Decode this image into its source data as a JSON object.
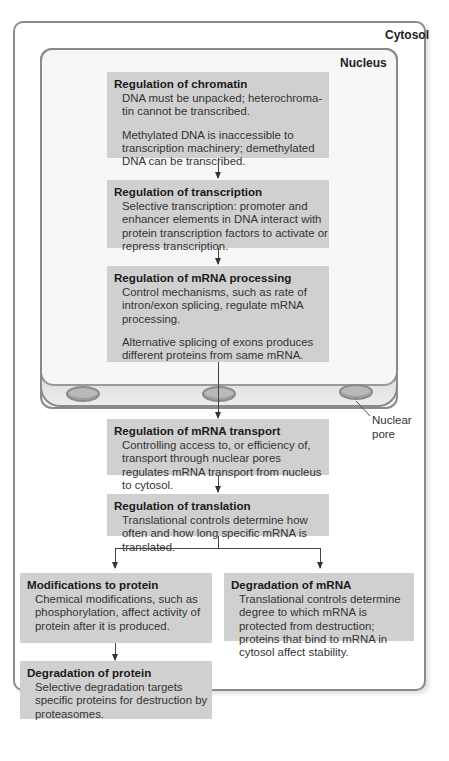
{
  "regions": {
    "cytosol_label": "Cytosol",
    "nucleus_label": "Nucleus",
    "nuclear_pore_label_line1": "Nuclear",
    "nuclear_pore_label_line2": "pore"
  },
  "boxes": {
    "chromatin": {
      "title": "Regulation of chromatin",
      "paragraphs": [
        "DNA must be unpacked; heterochroma-tin cannot be transcribed.",
        "Methylated DNA is inaccessible to transcription machinery; demethylated DNA can be transcribed."
      ]
    },
    "transcription": {
      "title": "Regulation of transcription",
      "paragraphs": [
        "Selective transcription: promoter and enhancer elements in DNA interact with protein transcription factors to activate or repress transcription."
      ]
    },
    "mrna_processing": {
      "title": "Regulation of mRNA processing",
      "paragraphs": [
        "Control mechanisms, such as rate of intron/exon splicing, regulate mRNA processing.",
        "Alternative splicing of exons produces different proteins from same mRNA."
      ]
    },
    "mrna_transport": {
      "title": "Regulation of mRNA transport",
      "paragraphs": [
        "Controlling access to, or efficiency of, transport through nuclear pores regulates mRNA transport from nucleus to cytosol."
      ]
    },
    "translation": {
      "title": "Regulation of translation",
      "paragraphs": [
        "Translational controls determine how often and how long specific mRNA is translated."
      ]
    },
    "protein_modification": {
      "title": "Modifications to protein",
      "paragraphs": [
        "Chemical modifications, such as phosphorylation, affect activity of protein after it is produced."
      ]
    },
    "mrna_degradation": {
      "title": "Degradation of mRNA",
      "paragraphs": [
        "Translational controls determine degree to which mRNA is protected from destruction; proteins that bind to mRNA in cytosol affect stability."
      ]
    },
    "protein_degradation": {
      "title": "Degradation of protein",
      "paragraphs": [
        "Selective degradation targets specific proteins for destruction by proteasomes."
      ]
    }
  }
}
